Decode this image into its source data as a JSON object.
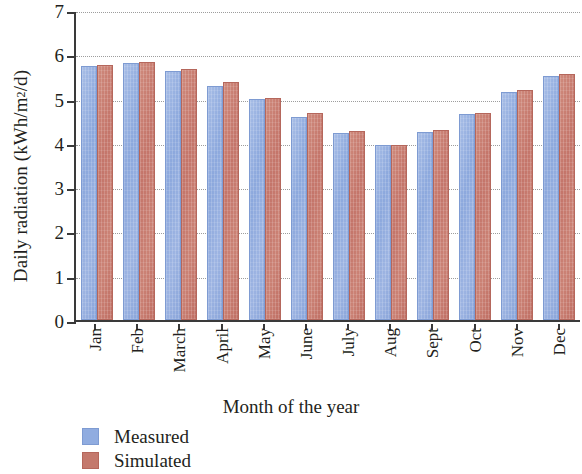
{
  "chart_data": {
    "type": "bar",
    "title": "",
    "xlabel": "Month of the year",
    "ylabel": "Daily radiation (kWh/m²/d)",
    "ylabel_parts": {
      "main": "Daily radiation (kWh/m",
      "sup": "2",
      "tail": "/d)"
    },
    "categories": [
      "Jan",
      "Feb",
      "March",
      "April",
      "May",
      "June",
      "July",
      "Aug",
      "Sept",
      "Oct",
      "Nov",
      "Dec"
    ],
    "series": [
      {
        "name": "Measured",
        "color": "#90ace0",
        "values": [
          5.68,
          5.75,
          5.58,
          5.25,
          4.95,
          4.55,
          4.17,
          3.9,
          4.2,
          4.6,
          5.1,
          5.47
        ]
      },
      {
        "name": "Simulated",
        "color": "#c4796d",
        "values": [
          5.72,
          5.77,
          5.62,
          5.33,
          4.97,
          4.62,
          4.22,
          3.9,
          4.25,
          4.62,
          5.15,
          5.52
        ]
      }
    ],
    "ylim": [
      0,
      7
    ],
    "yticks": [
      "0",
      "1",
      "2",
      "3",
      "4",
      "5",
      "6",
      "7"
    ],
    "grid": "horizontal-dotted",
    "legend_position": "bottom-left"
  }
}
